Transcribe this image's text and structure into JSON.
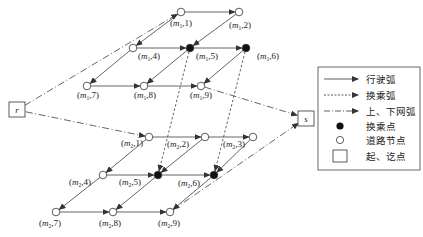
{
  "diagram": {
    "colors": {
      "line": "#333333",
      "node_fill_open": "#ffffff",
      "node_fill_transfer": "#111111",
      "background": "#ffffff"
    },
    "endpoints": {
      "r": {
        "label": "r",
        "x": 17,
        "y": 110
      },
      "s": {
        "label": "s",
        "x": 306,
        "y": 118
      }
    },
    "nodes": [
      {
        "id": "m1_1",
        "line": "m1",
        "idx": "1",
        "x": 181,
        "y": 12,
        "type": "road",
        "lx": 181,
        "ly": 26
      },
      {
        "id": "m1_2",
        "line": "m1",
        "idx": "2",
        "x": 239,
        "y": 12,
        "type": "road",
        "lx": 240,
        "ly": 28
      },
      {
        "id": "m1_4",
        "line": "m1",
        "idx": "4",
        "x": 133,
        "y": 48,
        "type": "road",
        "lx": 149,
        "ly": 59
      },
      {
        "id": "m1_5",
        "line": "m1",
        "idx": "5",
        "x": 190,
        "y": 48,
        "type": "transfer",
        "lx": 207,
        "ly": 59
      },
      {
        "id": "m1_6",
        "line": "m1",
        "idx": "6",
        "x": 246,
        "y": 48,
        "type": "transfer",
        "lx": 268,
        "ly": 59
      },
      {
        "id": "m1_7",
        "line": "m1",
        "idx": "7",
        "x": 87,
        "y": 86,
        "type": "road",
        "lx": 88,
        "ly": 98
      },
      {
        "id": "m1_8",
        "line": "m1",
        "idx": "8",
        "x": 144,
        "y": 86,
        "type": "road",
        "lx": 145,
        "ly": 98
      },
      {
        "id": "m1_9",
        "line": "m1",
        "idx": "9",
        "x": 201,
        "y": 86,
        "type": "road",
        "lx": 201,
        "ly": 98
      },
      {
        "id": "m2_1",
        "line": "m2",
        "idx": "1",
        "x": 149,
        "y": 137,
        "type": "road",
        "lx": 132,
        "ly": 146
      },
      {
        "id": "m2_2",
        "line": "m2",
        "idx": "2",
        "x": 205,
        "y": 137,
        "type": "road",
        "lx": 178,
        "ly": 147
      },
      {
        "id": "m2_3",
        "line": "m2",
        "idx": "3",
        "x": 253,
        "y": 137,
        "type": "road",
        "lx": 234,
        "ly": 147
      },
      {
        "id": "m2_4",
        "line": "m2",
        "idx": "4",
        "x": 103,
        "y": 175,
        "type": "road",
        "lx": 80,
        "ly": 185
      },
      {
        "id": "m2_5",
        "line": "m2",
        "idx": "5",
        "x": 158,
        "y": 175,
        "type": "transfer",
        "lx": 130,
        "ly": 185
      },
      {
        "id": "m2_6",
        "line": "m2",
        "idx": "6",
        "x": 214,
        "y": 175,
        "type": "transfer",
        "lx": 189,
        "ly": 186
      },
      {
        "id": "m2_7",
        "line": "m2",
        "idx": "7",
        "x": 56,
        "y": 212,
        "type": "road",
        "lx": 50,
        "ly": 226
      },
      {
        "id": "m2_8",
        "line": "m2",
        "idx": "8",
        "x": 113,
        "y": 212,
        "type": "road",
        "lx": 110,
        "ly": 226
      },
      {
        "id": "m2_9",
        "line": "m2",
        "idx": "9",
        "x": 170,
        "y": 212,
        "type": "road",
        "lx": 169,
        "ly": 226
      }
    ],
    "arcs": {
      "driving": [
        [
          "m1_1",
          "m1_2"
        ],
        [
          "m1_1",
          "m1_4"
        ],
        [
          "m1_2",
          "m1_5"
        ],
        [
          "m1_4",
          "m1_5"
        ],
        [
          "m1_5",
          "m1_6"
        ],
        [
          "m1_4",
          "m1_7"
        ],
        [
          "m1_5",
          "m1_8"
        ],
        [
          "m1_6",
          "m1_9"
        ],
        [
          "m1_7",
          "m1_8"
        ],
        [
          "m1_8",
          "m1_9"
        ],
        [
          "m2_1",
          "m2_2"
        ],
        [
          "m2_2",
          "m2_3"
        ],
        [
          "m2_1",
          "m2_4"
        ],
        [
          "m2_2",
          "m2_5"
        ],
        [
          "m2_3",
          "m2_6"
        ],
        [
          "m2_4",
          "m2_5"
        ],
        [
          "m2_5",
          "m2_6"
        ],
        [
          "m2_4",
          "m2_7"
        ],
        [
          "m2_5",
          "m2_8"
        ],
        [
          "m2_6",
          "m2_9"
        ],
        [
          "m2_7",
          "m2_8"
        ],
        [
          "m2_8",
          "m2_9"
        ]
      ],
      "transfer": [
        [
          "m1_5",
          "m2_5"
        ],
        [
          "m1_6",
          "m2_6"
        ]
      ],
      "access": [
        [
          "r",
          "m1_1"
        ],
        [
          "r",
          "m2_1"
        ],
        [
          "m1_9",
          "s"
        ],
        [
          "m2_9",
          "s"
        ]
      ]
    },
    "legend": {
      "items": [
        {
          "symbol": "solid-arrow",
          "label": "行驶弧"
        },
        {
          "symbol": "dashed-arrow",
          "label": "换乘弧"
        },
        {
          "symbol": "dashdot-arrow",
          "label": "上、下网弧"
        },
        {
          "symbol": "filled-circle",
          "label": "换乘点"
        },
        {
          "symbol": "open-circle",
          "label": "道路节点"
        },
        {
          "symbol": "square",
          "label": "起、讫点"
        }
      ]
    }
  }
}
